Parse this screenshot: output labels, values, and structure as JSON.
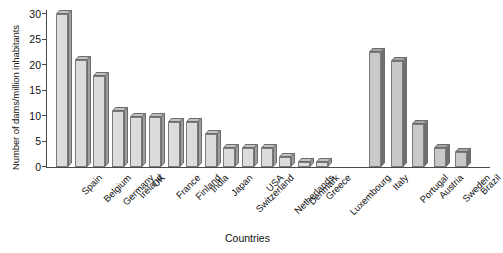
{
  "chart_data": {
    "type": "bar",
    "title": "",
    "xlabel": "Countries",
    "ylabel": "Number of dams/million inhabitants",
    "ylim": [
      0,
      30
    ],
    "yticks": [
      0,
      5,
      10,
      15,
      20,
      25,
      30
    ],
    "grid": false,
    "legend": "none",
    "orientation": "vertical",
    "style": "3d-shaded-bars",
    "groups": [
      {
        "name": "group-1",
        "color": "#dcdcdc",
        "categories": [
          "Spain",
          "Belgium",
          "Germany",
          "Ireland",
          "UK",
          "France",
          "Finland",
          "India",
          "Japan",
          "Switzerland",
          "USA",
          "Netherlands",
          "Denmark",
          "Greece",
          "Luxembourg"
        ],
        "values": [
          30.0,
          21.0,
          17.8,
          11.0,
          9.8,
          9.8,
          8.8,
          8.8,
          6.5,
          3.8,
          3.8,
          3.8,
          2.0,
          1.0,
          1.0
        ]
      },
      {
        "name": "group-2",
        "color": "#c9c9c9",
        "categories": [
          "Italy",
          "Portugal",
          "Austria",
          "Sweden",
          "Brazil"
        ],
        "values": [
          22.5,
          20.7,
          8.5,
          3.7,
          3.0
        ]
      }
    ],
    "categories": [
      "Spain",
      "Belgium",
      "Germany",
      "Ireland",
      "UK",
      "France",
      "Finland",
      "India",
      "Japan",
      "Switzerland",
      "USA",
      "Netherlands",
      "Denmark",
      "Greece",
      "Luxembourg",
      "Italy",
      "Portugal",
      "Austria",
      "Sweden",
      "Brazil"
    ],
    "values": [
      30.0,
      21.0,
      17.8,
      11.0,
      9.8,
      9.8,
      8.8,
      8.8,
      6.5,
      3.8,
      3.8,
      3.8,
      2.0,
      1.0,
      1.0,
      22.5,
      20.7,
      8.5,
      3.7,
      3.0
    ]
  }
}
